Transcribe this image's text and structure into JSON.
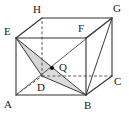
{
  "figure": {
    "type": "geometry-diagram",
    "canvas": {
      "width": 129,
      "height": 115
    },
    "colors": {
      "stroke_solid": "#333333",
      "stroke_dashed": "#555555",
      "shaded_fill": "#d9d9d9",
      "label_text": "#1a1a1a",
      "background": "#ffffff",
      "point_marker": "#111111"
    },
    "vertices": [
      {
        "name": "A",
        "label": "A",
        "x": 16,
        "y": 95,
        "label_x": 5,
        "label_y": 99,
        "hidden": false
      },
      {
        "name": "B",
        "label": "B",
        "x": 86,
        "y": 95,
        "label_x": 85,
        "label_y": 100,
        "hidden": false
      },
      {
        "name": "C",
        "label": "C",
        "x": 112,
        "y": 76,
        "label_x": 115,
        "label_y": 77,
        "hidden": false
      },
      {
        "name": "D",
        "label": "D",
        "x": 42,
        "y": 76,
        "label_x": 37,
        "label_y": 83,
        "hidden": true
      },
      {
        "name": "E",
        "label": "E",
        "x": 16,
        "y": 38,
        "label_x": 4,
        "label_y": 26,
        "hidden": false
      },
      {
        "name": "F",
        "label": "F",
        "x": 86,
        "y": 38,
        "label_x": 78,
        "label_y": 23,
        "hidden": false
      },
      {
        "name": "G",
        "label": "G",
        "x": 112,
        "y": 18,
        "label_x": 114,
        "label_y": 5,
        "hidden": false
      },
      {
        "name": "H",
        "label": "H",
        "x": 42,
        "y": 18,
        "label_x": 33,
        "label_y": 5,
        "hidden": true
      }
    ],
    "points": [
      {
        "name": "Q",
        "label": "Q",
        "x": 52,
        "y": 68,
        "label_x": 60,
        "label_y": 63,
        "marker": true
      }
    ],
    "edges_solid": [
      {
        "from": "A",
        "to": "B"
      },
      {
        "from": "B",
        "to": "C"
      },
      {
        "from": "A",
        "to": "E"
      },
      {
        "from": "B",
        "to": "F"
      },
      {
        "from": "C",
        "to": "G"
      },
      {
        "from": "E",
        "to": "F"
      },
      {
        "from": "F",
        "to": "G"
      },
      {
        "from": "E",
        "to": "H"
      },
      {
        "from": "H",
        "to": "G"
      }
    ],
    "edges_dashed": [
      {
        "from": "A",
        "to": "D"
      },
      {
        "from": "D",
        "to": "C"
      },
      {
        "from": "D",
        "to": "H"
      }
    ],
    "construction_lines": [
      {
        "from": "E",
        "to": "D",
        "style": "solid"
      },
      {
        "from": "E",
        "to": "B",
        "style": "solid"
      },
      {
        "from": "D",
        "to": "B",
        "style": "solid"
      },
      {
        "from": "B",
        "to": "G",
        "style": "solid"
      },
      {
        "from": "A",
        "to": "F",
        "style": "dashed-thin"
      }
    ],
    "shaded_region": {
      "name": "cross-section-EDBQ",
      "path_vertices": [
        "E",
        "D",
        "B",
        "Q"
      ],
      "fill": "#d9d9d9",
      "opacity": 0.85
    }
  }
}
